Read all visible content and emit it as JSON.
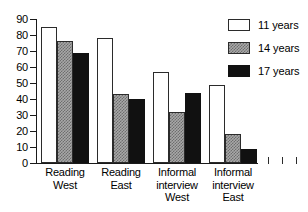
{
  "chart_data": {
    "type": "bar",
    "title": "",
    "subtitle": "",
    "xlabel": "",
    "ylabel": "",
    "ylim": [
      0,
      90
    ],
    "yticks": [
      0,
      10,
      20,
      30,
      40,
      50,
      60,
      70,
      80,
      90
    ],
    "ytick_labels": [
      "0",
      "10",
      "20",
      "30",
      "40",
      "50",
      "60",
      "70",
      "80",
      "90"
    ],
    "grid": false,
    "legend_position": "top-right",
    "categories": [
      "Reading\nWest",
      "Reading\nEast",
      "Informal\ninterview\nWest",
      "Informal\ninterview\nEast"
    ],
    "series": [
      {
        "name": "11 years",
        "color": "#ffffff",
        "pattern": "open",
        "values": [
          85,
          78,
          57,
          49
        ]
      },
      {
        "name": "14 years",
        "color": "#a8a8a8",
        "pattern": "checker",
        "values": [
          76,
          43,
          32,
          18
        ]
      },
      {
        "name": "17 years",
        "color": "#111111",
        "pattern": "solid",
        "values": [
          69,
          40,
          44,
          9
        ]
      }
    ],
    "extra_axis_ticks": 3,
    "annotations": []
  },
  "legend": {
    "entries": [
      {
        "label": "11 years"
      },
      {
        "label": "14 years"
      },
      {
        "label": "17 years"
      }
    ]
  }
}
